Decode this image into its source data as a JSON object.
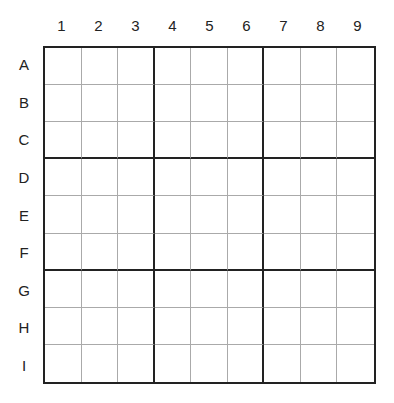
{
  "puzzle": {
    "type": "sudoku-grid",
    "columns": [
      "1",
      "2",
      "3",
      "4",
      "5",
      "6",
      "7",
      "8",
      "9"
    ],
    "rows": [
      "A",
      "B",
      "C",
      "D",
      "E",
      "F",
      "G",
      "H",
      "I"
    ],
    "cells": [
      [
        "",
        "",
        "",
        "",
        "",
        "",
        "",
        "",
        ""
      ],
      [
        "",
        "",
        "",
        "",
        "",
        "",
        "",
        "",
        ""
      ],
      [
        "",
        "",
        "",
        "",
        "",
        "",
        "",
        "",
        ""
      ],
      [
        "",
        "",
        "",
        "",
        "",
        "",
        "",
        "",
        ""
      ],
      [
        "",
        "",
        "",
        "",
        "",
        "",
        "",
        "",
        ""
      ],
      [
        "",
        "",
        "",
        "",
        "",
        "",
        "",
        "",
        ""
      ],
      [
        "",
        "",
        "",
        "",
        "",
        "",
        "",
        "",
        ""
      ],
      [
        "",
        "",
        "",
        "",
        "",
        "",
        "",
        "",
        ""
      ],
      [
        "",
        "",
        "",
        "",
        "",
        "",
        "",
        "",
        ""
      ]
    ]
  }
}
